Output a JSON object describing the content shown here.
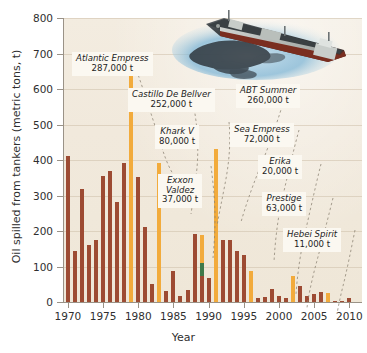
{
  "chart_data": {
    "type": "bar",
    "title": "",
    "xlabel": "Year",
    "ylabel": "Oil spilled from tankers (metric tons, t)",
    "ylim": [
      0,
      800
    ],
    "xlim": [
      1969.3,
      2011.8
    ],
    "yticks": [
      0,
      100,
      200,
      300,
      400,
      500,
      600,
      700,
      800
    ],
    "xticks": [
      1970,
      1975,
      1980,
      1985,
      1990,
      1995,
      2000,
      2005,
      2010
    ],
    "grid": true,
    "legend": "none",
    "units_note": "values in thousands of metric tons",
    "categories": [
      1970,
      1971,
      1972,
      1973,
      1974,
      1975,
      1976,
      1977,
      1978,
      1979,
      1980,
      1981,
      1982,
      1983,
      1984,
      1985,
      1986,
      1987,
      1988,
      1989,
      1990,
      1991,
      1992,
      1993,
      1994,
      1995,
      1996,
      1997,
      1998,
      1999,
      2000,
      2001,
      2002,
      2003,
      2004,
      2005,
      2006,
      2007,
      2008,
      2009,
      2010
    ],
    "values": [
      412,
      145,
      318,
      161,
      175,
      355,
      369,
      281,
      393,
      642,
      352,
      212,
      52,
      391,
      30,
      88,
      18,
      33,
      191,
      188,
      68,
      432,
      174,
      174,
      145,
      132,
      87,
      12,
      14,
      38,
      16,
      10,
      74,
      46,
      18,
      22,
      28,
      26,
      4,
      2,
      10
    ],
    "series": [
      {
        "name": "Total oil spilled",
        "values": [
          412,
          145,
          318,
          161,
          175,
          355,
          369,
          281,
          393,
          642,
          352,
          212,
          52,
          391,
          30,
          88,
          18,
          33,
          191,
          188,
          68,
          432,
          174,
          174,
          145,
          132,
          87,
          12,
          14,
          38,
          16,
          10,
          74,
          46,
          18,
          22,
          28,
          26,
          4,
          2,
          10
        ]
      }
    ],
    "bar_colors": {
      "default": "#9d4b33",
      "highlight": "#f2ab3c",
      "exxon_valdez": "#3f7a4a"
    },
    "highlight_years": [
      1979,
      1983,
      1989,
      1991,
      1996,
      2002,
      2007
    ],
    "annotations": [
      {
        "id": "atlantic-empress",
        "name": "Atlantic Empress",
        "amount": "287,000 t",
        "year": 1979
      },
      {
        "id": "castillo-de-bellver",
        "name": "Castillo De Bellver",
        "amount": "252,000 t",
        "year": 1983
      },
      {
        "id": "khark-v",
        "name": "Khark V",
        "amount": "80,000 t",
        "year": 1989
      },
      {
        "id": "exxon-valdez",
        "name": "Exxon Valdez",
        "amount": "37,000 t",
        "year": 1989
      },
      {
        "id": "abt-summer",
        "name": "ABT Summer",
        "amount": "260,000 t",
        "year": 1991
      },
      {
        "id": "sea-empress",
        "name": "Sea Empress",
        "amount": "72,000 t",
        "year": 1996
      },
      {
        "id": "erika",
        "name": "Erika",
        "amount": "20,000 t",
        "year": 1999
      },
      {
        "id": "prestige",
        "name": "Prestige",
        "amount": "63,000 t",
        "year": 2002
      },
      {
        "id": "hebei-spirit",
        "name": "Hebei Spirit",
        "amount": "11,000 t",
        "year": 2007
      }
    ]
  },
  "axes": {
    "ylabel": "Oil spilled from tankers (metric tons, t)",
    "xlabel": "Year",
    "yticks": [
      "0",
      "100",
      "200",
      "300",
      "400",
      "500",
      "600",
      "700",
      "800"
    ],
    "xticks": [
      "1970",
      "1975",
      "1980",
      "1985",
      "1990",
      "1995",
      "2000",
      "2005",
      "2010"
    ]
  },
  "callouts": [
    {
      "name": "Atlantic Empress",
      "amount": "287,000 t"
    },
    {
      "name": "Castillo De Bellver",
      "amount": "252,000 t"
    },
    {
      "name": "Khark V",
      "amount": "80,000 t"
    },
    {
      "name": "Exxon",
      "amount": "Valdez"
    },
    {
      "name": "Exxon Valdez",
      "amount": "37,000 t"
    },
    {
      "name": "ABT Summer",
      "amount": "260,000 t"
    },
    {
      "name": "Sea Empress",
      "amount": "72,000 t"
    },
    {
      "name": "Erika",
      "amount": "20,000 t"
    },
    {
      "name": "Prestige",
      "amount": "63,000 t"
    },
    {
      "name": "Hebei Spirit",
      "amount": "11,000 t"
    }
  ],
  "callout_lines": {
    "exxon_line1": "Exxon",
    "exxon_line2": "Valdez",
    "exxon_amt": "37,000 t"
  },
  "illustration": {
    "name": "oil-tanker-with-spill",
    "alt": "Oil tanker ship leaking a dark oil slick on blue water"
  },
  "colors": {
    "panel": "#f1e9dc",
    "bar": "#9d4b33",
    "highlight": "#f2ab3c",
    "green": "#3f7a4a",
    "axis": "#9a9287",
    "text": "#2f2f2f"
  }
}
